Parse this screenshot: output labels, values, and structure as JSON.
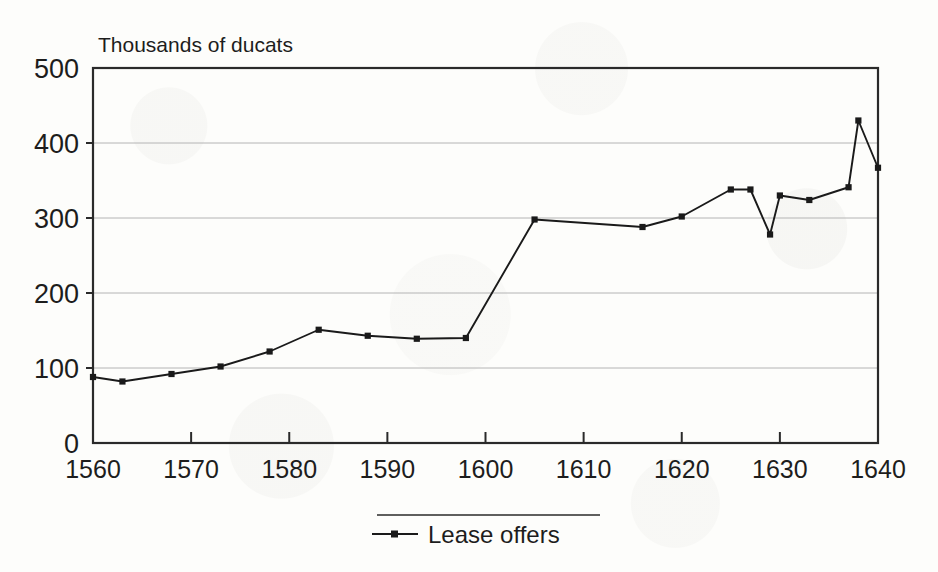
{
  "chart_data": {
    "type": "line",
    "title": "",
    "subtitle": "",
    "unit_caption": "Thousands of ducats",
    "xlabel": "",
    "ylabel": "",
    "xlim": [
      1560,
      1640
    ],
    "ylim": [
      0,
      500
    ],
    "grid": true,
    "grid_axis": "y",
    "legend_position": "bottom-center",
    "y_ticks": [
      0,
      100,
      200,
      300,
      400,
      500
    ],
    "y_tick_labels": [
      "0",
      "100",
      "200",
      "300",
      "400",
      "500"
    ],
    "x_ticks": [
      1560,
      1570,
      1580,
      1590,
      1600,
      1610,
      1620,
      1630,
      1640
    ],
    "x_tick_labels": [
      "1560",
      "1570",
      "1580",
      "1590",
      "1600",
      "1610",
      "1620",
      "1630",
      "1640"
    ],
    "series": [
      {
        "name": "Lease offers",
        "marker": "square",
        "color": "#1a1a1a",
        "x": [
          1560,
          1563,
          1568,
          1573,
          1578,
          1583,
          1588,
          1593,
          1598,
          1605,
          1616,
          1620,
          1625,
          1627,
          1629,
          1630,
          1633,
          1637,
          1638,
          1640
        ],
        "values": [
          88,
          82,
          92,
          102,
          122,
          151,
          143,
          139,
          140,
          298,
          288,
          302,
          338,
          338,
          278,
          330,
          324,
          341,
          430,
          367
        ]
      }
    ]
  },
  "legend": {
    "entries": [
      {
        "label": "Lease offers",
        "color": "#1a1a1a"
      }
    ]
  },
  "colors": {
    "series": "#1a1a1a",
    "grid": "#b4b4b4",
    "frame": "#2a2a2a",
    "text": "#1d1d1d",
    "background": "#fdfdfb"
  }
}
